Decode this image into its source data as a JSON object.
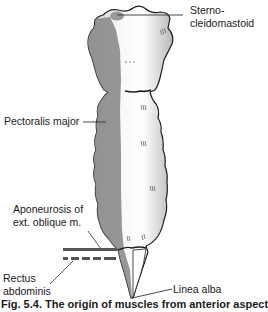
{
  "figure": {
    "caption": "Fig. 5.4. The origin of muscles from anterior aspect"
  },
  "labels": {
    "sternocleidomastoid_line1": "Sterno-",
    "sternocleidomastoid_line2": "cleidomastoid",
    "pectoralis_major": "Pectoralis major",
    "aponeurosis_line1": "Aponeurosis of",
    "aponeurosis_line2": "ext. oblique m.",
    "rectus_line1": "Rectus",
    "rectus_line2": "abdominis",
    "linea_alba": "Linea alba"
  },
  "legend": {
    "solid_bar": "Aponeurosis of ext. oblique m.",
    "dashed_bar": "Rectus abdominis"
  },
  "colors": {
    "bone_fill": "#f4f4f4",
    "bone_shade": "#c8c8c8",
    "muscle_area": "#8c8c8c",
    "outline": "#1e1e1e",
    "leader_line": "#333333",
    "legend_bar": "#555555"
  }
}
